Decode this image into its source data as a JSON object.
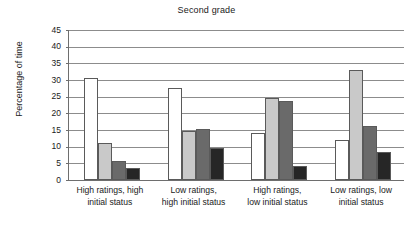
{
  "chart_data": {
    "type": "bar",
    "title": "Second grade",
    "xlabel": "",
    "ylabel": "Percentage of time",
    "ylim": [
      0,
      45
    ],
    "ytick_step": 5,
    "yticks": [
      45,
      40,
      35,
      30,
      25,
      20,
      15,
      10,
      5,
      0
    ],
    "grid": true,
    "legend": "none",
    "categories": [
      "High ratings, high initial status",
      "Low ratings, high initial status",
      "High ratings, low initial status",
      "Low ratings, low initial status"
    ],
    "category_lines": [
      [
        "High ratings, high",
        "initial status"
      ],
      [
        "Low ratings,",
        "high initial status"
      ],
      [
        "High ratings,",
        "low initial status"
      ],
      [
        "Low ratings, low",
        "initial status"
      ]
    ],
    "series": [
      {
        "name": "series-1",
        "color": "#ffffff",
        "values": [
          30.5,
          27.6,
          14.2,
          11.9
        ]
      },
      {
        "name": "series-2",
        "color": "#c9c9c9",
        "values": [
          11.1,
          14.8,
          24.6,
          33.1
        ]
      },
      {
        "name": "series-3",
        "color": "#6a6a6a",
        "values": [
          5.6,
          15.2,
          23.8,
          16.3
        ]
      },
      {
        "name": "series-4",
        "color": "#262626",
        "values": [
          3.5,
          9.5,
          4.3,
          8.5
        ]
      }
    ]
  }
}
